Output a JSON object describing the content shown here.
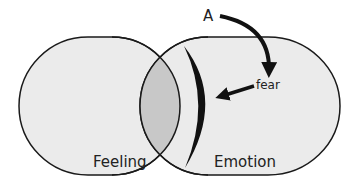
{
  "diagram": {
    "type": "venn",
    "sets": [
      {
        "label": "Feeling",
        "fill": "#ebebeb"
      },
      {
        "label": "Emotion",
        "fill": "#ebebeb"
      }
    ],
    "intersection": {
      "fill": "#c8c8c8",
      "boundary_highlight": "#111111"
    },
    "annotations": {
      "start_label": "A",
      "target_label": "fear"
    },
    "stroke_color": "#1a1a1a"
  }
}
